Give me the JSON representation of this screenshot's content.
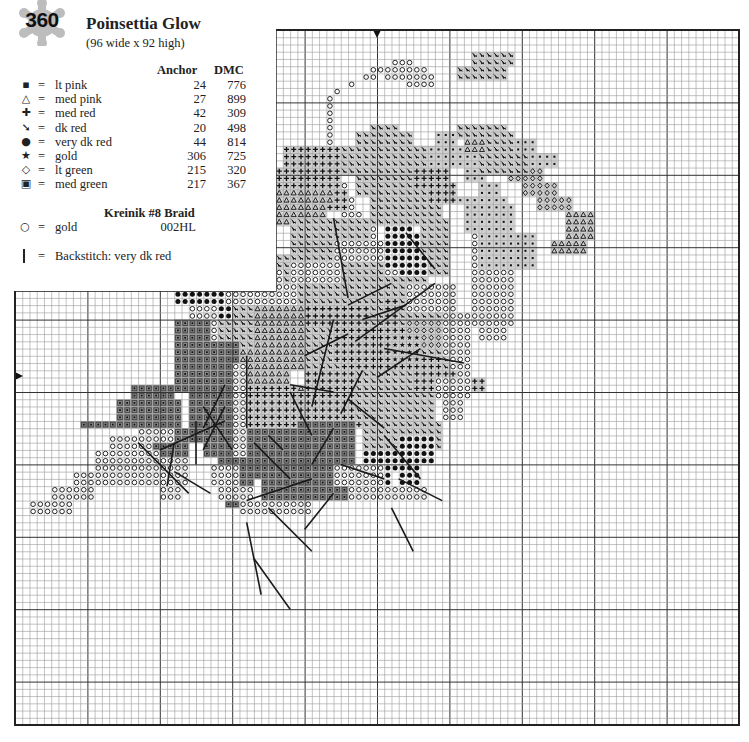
{
  "header": {
    "pattern_number": "360",
    "title": "Poinsettia Glow",
    "dimensions": "(96 wide x 92 high)"
  },
  "legend": {
    "col_anchor": "Anchor",
    "col_dmc": "DMC",
    "items": [
      {
        "symbol": "▪",
        "eq": "=",
        "name": "lt pink",
        "anchor": "24",
        "dmc": "776"
      },
      {
        "symbol": "△",
        "eq": "=",
        "name": "med pink",
        "anchor": "27",
        "dmc": "899"
      },
      {
        "symbol": "✚",
        "eq": "=",
        "name": "med red",
        "anchor": "42",
        "dmc": "309"
      },
      {
        "symbol": "➘",
        "eq": "=",
        "name": "dk red",
        "anchor": "20",
        "dmc": "498"
      },
      {
        "symbol": "●",
        "eq": "=",
        "name": "very dk red",
        "anchor": "44",
        "dmc": "814"
      },
      {
        "symbol": "★",
        "eq": "=",
        "name": "gold",
        "anchor": "306",
        "dmc": "725"
      },
      {
        "symbol": "◇",
        "eq": "=",
        "name": "lt green",
        "anchor": "215",
        "dmc": "320"
      },
      {
        "symbol": "▣",
        "eq": "=",
        "name": "med green",
        "anchor": "217",
        "dmc": "367"
      }
    ],
    "kreinik_heading": "Kreinik #8 Braid",
    "braid": {
      "symbol": "○",
      "eq": "=",
      "name": "gold",
      "code": "002HL"
    },
    "backstitch": {
      "eq": "=",
      "label": "Backstitch: very dk red"
    }
  },
  "grid": {
    "cell": 7.24,
    "x0": 15,
    "y0": 30,
    "right": 738,
    "bottom": 723,
    "notch_right": 276,
    "notch_bottom": 291,
    "major_every": 10,
    "center_mark_top_x": 377,
    "center_mark_left_y": 376,
    "colors": {
      "line": "#9a9a9a",
      "major": "#333333",
      "border": "#222222",
      "fill_dk": "#8c8c8c",
      "fill_lt": "#cfcfcf",
      "ink": "#111111"
    }
  },
  "chart_regions": [
    {
      "sym": "O",
      "rows": [
        [
          4,
          4,
          52,
          54
        ],
        [
          5,
          5,
          49,
          56
        ],
        [
          6,
          6,
          48,
          49
        ],
        [
          6,
          6,
          51,
          57
        ],
        [
          7,
          7,
          46,
          46
        ],
        [
          7,
          7,
          54,
          57
        ],
        [
          8,
          8,
          44,
          44
        ],
        [
          9,
          9,
          43,
          43
        ],
        [
          10,
          18,
          43,
          43
        ],
        [
          19,
          20,
          43,
          44
        ],
        [
          21,
          22,
          43,
          45
        ],
        [
          23,
          24,
          44,
          46
        ],
        [
          25,
          26,
          45,
          47
        ],
        [
          27,
          28,
          46,
          49
        ],
        [
          29,
          30,
          47,
          50
        ],
        [
          31,
          32,
          48,
          51
        ],
        [
          33,
          34,
          49,
          52
        ]
      ]
    },
    {
      "sym": "D",
      "rows": [
        [
          14,
          14,
          64,
          66
        ],
        [
          15,
          16,
          64,
          68
        ],
        [
          17,
          18,
          66,
          70
        ],
        [
          19,
          20,
          68,
          72
        ],
        [
          21,
          22,
          70,
          74
        ],
        [
          23,
          24,
          72,
          76
        ]
      ]
    },
    {
      "sym": "M",
      "rows": [
        [
          14,
          15,
          58,
          60
        ],
        [
          16,
          18,
          56,
          63
        ],
        [
          19,
          20,
          62,
          64
        ],
        [
          21,
          22,
          64,
          66
        ],
        [
          23,
          24,
          65,
          67
        ]
      ]
    },
    {
      "sym": "O",
      "rows": [
        [
          25,
          25,
          64,
          67
        ],
        [
          26,
          40,
          63,
          68
        ],
        [
          41,
          42,
          64,
          67
        ],
        [
          43,
          44,
          58,
          61
        ]
      ]
    },
    {
      "sym": "O",
      "rows": [
        [
          44,
          46,
          45,
          54
        ],
        [
          47,
          49,
          43,
          52
        ],
        [
          50,
          53,
          47,
          50
        ]
      ]
    },
    {
      "sym": "A",
      "rows": [
        [
          14,
          16,
          62,
          65
        ],
        [
          25,
          28,
          76,
          79
        ],
        [
          29,
          30,
          74,
          78
        ]
      ]
    },
    {
      "sym": "M",
      "rows": [
        [
          13,
          14,
          62,
          64
        ],
        [
          15,
          16,
          66,
          71
        ],
        [
          17,
          18,
          70,
          74
        ]
      ]
    },
    {
      "sym": "M",
      "rows": [
        [
          23,
          23,
          61,
          67
        ],
        [
          24,
          27,
          62,
          68
        ],
        [
          28,
          32,
          64,
          71
        ]
      ]
    },
    {
      "sym": "B",
      "rows": [
        [
          26,
          27,
          51,
          54
        ],
        [
          28,
          32,
          51,
          56
        ],
        [
          33,
          33,
          53,
          57
        ]
      ]
    },
    {
      "sym": "X",
      "rows": [
        [
          26,
          30,
          56,
          59
        ],
        [
          31,
          33,
          57,
          59
        ]
      ]
    },
    {
      "sym": "X",
      "rows": [
        [
          13,
          13,
          63,
          67
        ],
        [
          14,
          16,
          65,
          68
        ],
        [
          17,
          19,
          64,
          70
        ]
      ]
    },
    {
      "sym": "X",
      "rows": [
        [
          3,
          4,
          63,
          68
        ],
        [
          5,
          6,
          61,
          67
        ]
      ]
    },
    {
      "sym": "X",
      "rows": [
        [
          13,
          14,
          63,
          67
        ]
      ]
    },
    {
      "sym": "X",
      "rows": [
        [
          13,
          14,
          61,
          66
        ]
      ]
    },
    {
      "sym": "X",
      "rows": [
        [
          13,
          13,
          49,
          52
        ],
        [
          14,
          15,
          47,
          54
        ],
        [
          16,
          19,
          45,
          56
        ],
        [
          20,
          22,
          47,
          57
        ],
        [
          23,
          26,
          49,
          58
        ]
      ]
    },
    {
      "sym": "P",
      "rows": [
        [
          16,
          18,
          37,
          44
        ],
        [
          19,
          21,
          35,
          44
        ],
        [
          22,
          24,
          34,
          45
        ]
      ]
    },
    {
      "sym": "A",
      "rows": [
        [
          22,
          23,
          34,
          43
        ],
        [
          24,
          26,
          33,
          42
        ]
      ]
    },
    {
      "sym": "P",
      "rows": [
        [
          19,
          21,
          55,
          59
        ],
        [
          21,
          23,
          57,
          60
        ]
      ]
    },
    {
      "sym": "X",
      "rows": [
        [
          26,
          30,
          38,
          48
        ],
        [
          31,
          40,
          36,
          50
        ]
      ]
    },
    {
      "sym": "G",
      "rows": [
        [
          24,
          26,
          30,
          34
        ],
        [
          27,
          28,
          28,
          33
        ]
      ]
    },
    {
      "sym": "X",
      "rows": [
        [
          34,
          36,
          50,
          56
        ],
        [
          37,
          44,
          52,
          60
        ],
        [
          45,
          47,
          55,
          61
        ]
      ]
    },
    {
      "sym": "P",
      "rows": [
        [
          37,
          44,
          48,
          52
        ],
        [
          45,
          48,
          51,
          58
        ]
      ]
    },
    {
      "sym": "O",
      "rows": [
        [
          35,
          38,
          54,
          60
        ],
        [
          39,
          44,
          59,
          62
        ],
        [
          45,
          49,
          60,
          62
        ]
      ]
    },
    {
      "sym": "P",
      "rows": [
        [
          48,
          49,
          61,
          64
        ]
      ]
    },
    {
      "sym": "O",
      "rows": [
        [
          29,
          31,
          44,
          50
        ],
        [
          32,
          34,
          38,
          44
        ]
      ]
    },
    {
      "sym": "X",
      "rows": [
        [
          38,
          41,
          25,
          36
        ],
        [
          42,
          44,
          26,
          35
        ]
      ]
    },
    {
      "sym": "B",
      "rows": [
        [
          35,
          37,
          22,
          29
        ],
        [
          38,
          39,
          26,
          29
        ]
      ]
    },
    {
      "sym": "O",
      "rows": [
        [
          33,
          34,
          30,
          36
        ],
        [
          35,
          37,
          29,
          38
        ],
        [
          38,
          45,
          24,
          27
        ],
        [
          46,
          50,
          27,
          30
        ]
      ]
    },
    {
      "sym": "A",
      "rows": [
        [
          38,
          46,
          33,
          40
        ],
        [
          47,
          49,
          33,
          37
        ]
      ]
    },
    {
      "sym": "X",
      "rows": [
        [
          38,
          48,
          40,
          47
        ],
        [
          36,
          48,
          47,
          50
        ]
      ]
    },
    {
      "sym": "P",
      "rows": [
        [
          38,
          40,
          40,
          48
        ],
        [
          41,
          45,
          44,
          54
        ],
        [
          46,
          48,
          45,
          55
        ]
      ]
    },
    {
      "sym": "D",
      "rows": [
        [
          40,
          43,
          54,
          58
        ]
      ]
    },
    {
      "sym": "S",
      "rows": [
        [
          42,
          45,
          52,
          55
        ]
      ]
    },
    {
      "sym": "A",
      "rows": [
        [
          44,
          48,
          29,
          36
        ],
        [
          49,
          52,
          30,
          40
        ],
        [
          53,
          56,
          36,
          42
        ]
      ]
    },
    {
      "sym": "P",
      "rows": [
        [
          47,
          49,
          40,
          47
        ],
        [
          50,
          54,
          39,
          47
        ]
      ]
    },
    {
      "sym": "B",
      "rows": [
        [
          49,
          51,
          47,
          49
        ],
        [
          52,
          60,
          48,
          52
        ],
        [
          61,
          64,
          49,
          51
        ]
      ]
    },
    {
      "sym": "G",
      "rows": [
        [
          40,
          42,
          22,
          26
        ],
        [
          43,
          49,
          22,
          30
        ],
        [
          50,
          54,
          24,
          32
        ],
        [
          55,
          58,
          26,
          36
        ],
        [
          59,
          60,
          28,
          34
        ],
        [
          61,
          65,
          29,
          32
        ]
      ]
    },
    {
      "sym": "G",
      "rows": [
        [
          49,
          50,
          16,
          21
        ],
        [
          51,
          54,
          14,
          22
        ]
      ]
    },
    {
      "sym": "G",
      "rows": [
        [
          54,
          61,
          32,
          46
        ],
        [
          62,
          64,
          34,
          45
        ]
      ]
    },
    {
      "sym": "P",
      "rows": [
        [
          49,
          54,
          30,
          38
        ]
      ]
    },
    {
      "sym": "O",
      "rows": [
        [
          46,
          58,
          30,
          31
        ],
        [
          55,
          62,
          17,
          23
        ],
        [
          59,
          64,
          20,
          22
        ]
      ]
    },
    {
      "sym": "X",
      "rows": [
        [
          47,
          53,
          47,
          57
        ],
        [
          54,
          57,
          48,
          58
        ]
      ]
    },
    {
      "sym": "P",
      "rows": [
        [
          47,
          49,
          55,
          60
        ]
      ]
    },
    {
      "sym": "O",
      "rows": [
        [
          48,
          50,
          58,
          62
        ],
        [
          51,
          53,
          59,
          61
        ]
      ]
    },
    {
      "sym": "B",
      "rows": [
        [
          56,
          59,
          53,
          57
        ],
        [
          60,
          62,
          53,
          55
        ]
      ]
    },
    {
      "sym": "O",
      "rows": [
        [
          60,
          62,
          44,
          50
        ],
        [
          63,
          64,
          46,
          56
        ]
      ]
    },
    {
      "sym": "G",
      "rows": [
        [
          55,
          56,
          22,
          25
        ],
        [
          57,
          58,
          19,
          23
        ],
        [
          54,
          54,
          9,
          21
        ]
      ]
    },
    {
      "sym": "O",
      "rows": [
        [
          56,
          57,
          13,
          17
        ],
        [
          58,
          60,
          11,
          19
        ],
        [
          61,
          62,
          8,
          16
        ],
        [
          63,
          64,
          5,
          10
        ],
        [
          65,
          66,
          2,
          7
        ]
      ]
    },
    {
      "sym": "O",
      "rows": [
        [
          60,
          62,
          27,
          30
        ],
        [
          63,
          64,
          28,
          32
        ],
        [
          65,
          66,
          31,
          40
        ]
      ]
    }
  ],
  "backstitch_lines": [
    [
      [
        57,
        17
      ],
      [
        64,
        24
      ]
    ],
    [
      [
        61,
        22
      ],
      [
        64,
        27
      ]
    ],
    [
      [
        54,
        25
      ],
      [
        60,
        25
      ]
    ],
    [
      [
        57,
        22
      ],
      [
        63,
        21
      ]
    ],
    [
      [
        52,
        26
      ],
      [
        58,
        30
      ]
    ],
    [
      [
        45,
        32
      ],
      [
        55,
        32
      ]
    ],
    [
      [
        57,
        33
      ],
      [
        62,
        38
      ]
    ],
    [
      [
        66,
        35
      ],
      [
        72,
        41
      ]
    ],
    [
      [
        73,
        33
      ],
      [
        80,
        38
      ]
    ],
    [
      [
        68,
        32
      ],
      [
        78,
        34
      ]
    ],
    [
      [
        50,
        38
      ],
      [
        56,
        41
      ]
    ],
    [
      [
        49,
        38
      ],
      [
        50,
        44
      ]
    ],
    [
      [
        45,
        40
      ],
      [
        42,
        46
      ]
    ],
    [
      [
        40,
        44
      ],
      [
        52,
        41
      ]
    ],
    [
      [
        53,
        45
      ],
      [
        47,
        48
      ]
    ],
    [
      [
        55,
        44
      ],
      [
        60,
        41
      ]
    ],
    [
      [
        60,
        45
      ],
      [
        62,
        51
      ]
    ],
    [
      [
        48,
        50
      ],
      [
        44,
        56
      ]
    ],
    [
      [
        51,
        46
      ],
      [
        55,
        51
      ]
    ],
    [
      [
        38,
        46
      ],
      [
        35,
        52
      ]
    ],
    [
      [
        40,
        48
      ],
      [
        38,
        54
      ]
    ],
    [
      [
        56,
        51
      ],
      [
        62,
        56
      ]
    ],
    [
      [
        66,
        52
      ],
      [
        72,
        55
      ]
    ],
    [
      [
        62,
        53
      ],
      [
        65,
        59
      ]
    ],
    [
      [
        44,
        51
      ],
      [
        46,
        62
      ]
    ],
    [
      [
        28,
        54
      ],
      [
        33,
        58
      ]
    ],
    [
      [
        26,
        44
      ],
      [
        37,
        46
      ]
    ],
    [
      [
        35,
        58
      ],
      [
        43,
        47
      ]
    ],
    [
      [
        55,
        26
      ],
      [
        49,
        29
      ]
    ],
    [
      [
        58,
        26
      ],
      [
        52,
        29
      ]
    ],
    [
      [
        58,
        20
      ],
      [
        54,
        29
      ]
    ],
    [
      [
        69,
        40
      ],
      [
        64,
        44
      ]
    ],
    [
      [
        65,
        32
      ],
      [
        62,
        41
      ]
    ],
    [
      [
        56,
        35
      ],
      [
        58,
        37
      ]
    ]
  ]
}
